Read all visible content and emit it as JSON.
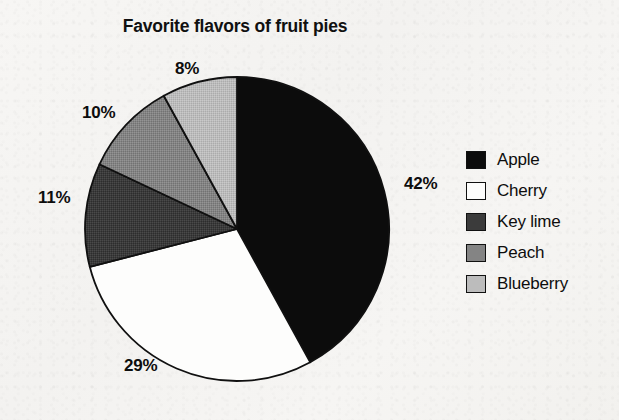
{
  "chart_data": {
    "type": "pie",
    "title": "Favorite flavors of fruit pies",
    "xlabel": "",
    "ylabel": "",
    "legend_position": "right",
    "grid": false,
    "units": "percent",
    "total": 100,
    "start_angle_deg": 0,
    "direction": "clockwise",
    "categories": [
      "Apple",
      "Cherry",
      "Key lime",
      "Peach",
      "Blueberry"
    ],
    "values": [
      42,
      29,
      11,
      10,
      8
    ],
    "labels": [
      "42%",
      "29%",
      "11%",
      "10%",
      "8%"
    ],
    "colors": [
      "#0c0c0c",
      "#fdfdfc",
      "#3b3b3b",
      "#848484",
      "#bcbcbc"
    ],
    "slices": [
      {
        "name": "Apple",
        "value": 42,
        "label": "42%",
        "color": "#0c0c0c",
        "start_deg": 0,
        "end_deg": 151.2
      },
      {
        "name": "Cherry",
        "value": 29,
        "label": "29%",
        "color": "#fdfdfc",
        "start_deg": 151.2,
        "end_deg": 255.6
      },
      {
        "name": "Key lime",
        "value": 11,
        "label": "11%",
        "color": "#3b3b3b",
        "start_deg": 255.6,
        "end_deg": 295.2
      },
      {
        "name": "Peach",
        "value": 10,
        "label": "10%",
        "color": "#848484",
        "start_deg": 295.2,
        "end_deg": 331.2
      },
      {
        "name": "Blueberry",
        "value": 8,
        "label": "8%",
        "color": "#bcbcbc",
        "start_deg": 331.2,
        "end_deg": 360
      }
    ]
  },
  "title": "Favorite flavors of fruit pies",
  "percent_labels": {
    "apple": "42%",
    "cherry": "29%",
    "key_lime": "11%",
    "peach": "10%",
    "blueberry": "8%"
  },
  "legend": {
    "items": [
      {
        "label": "Apple",
        "color": "#0c0c0c"
      },
      {
        "label": "Cherry",
        "color": "#fdfdfc"
      },
      {
        "label": "Key lime",
        "color": "#3b3b3b"
      },
      {
        "label": "Peach",
        "color": "#848484"
      },
      {
        "label": "Blueberry",
        "color": "#bcbcbc"
      }
    ]
  }
}
